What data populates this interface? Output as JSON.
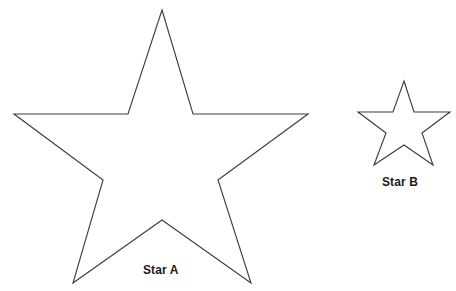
{
  "page": {
    "background_color": "#ffffff",
    "width": 456,
    "height": 291
  },
  "figure": {
    "stroke_color": "#3f3f3f",
    "fill_color": "#ffffff",
    "stroke_width": 1.15,
    "label_color": "#1b1b1b"
  },
  "shapes": [
    {
      "id": "star-a",
      "label": "Star A",
      "type": "five-pointed-star",
      "center": {
        "x": 162,
        "y": 150
      },
      "outer_radius": 146,
      "inner_radius": 57,
      "rotation_deg": -90,
      "points": [
        {
          "name": "top-tip",
          "x": 162,
          "y": 10
        },
        {
          "name": "inner-upper-right",
          "x": 193,
          "y": 114
        },
        {
          "name": "right-tip",
          "x": 308,
          "y": 114
        },
        {
          "name": "inner-lower-right",
          "x": 218,
          "y": 180
        },
        {
          "name": "bottom-right-tip",
          "x": 251,
          "y": 283
        },
        {
          "name": "inner-bottom",
          "x": 162,
          "y": 220
        },
        {
          "name": "bottom-left-tip",
          "x": 73,
          "y": 283
        },
        {
          "name": "inner-lower-left",
          "x": 103,
          "y": 180
        },
        {
          "name": "left-tip",
          "x": 14,
          "y": 114
        },
        {
          "name": "inner-upper-left",
          "x": 128,
          "y": 114
        }
      ],
      "label_position": {
        "x": 143,
        "y": 264
      }
    },
    {
      "id": "star-b",
      "label": "Star B",
      "type": "five-pointed-star",
      "center": {
        "x": 404,
        "y": 124
      },
      "outer_radius": 46,
      "inner_radius": 18,
      "rotation_deg": -90,
      "points": [
        {
          "name": "top-tip",
          "x": 404,
          "y": 81
        },
        {
          "name": "inner-upper-right",
          "x": 414,
          "y": 112
        },
        {
          "name": "right-tip",
          "x": 450,
          "y": 112
        },
        {
          "name": "inner-lower-right",
          "x": 422,
          "y": 133
        },
        {
          "name": "bottom-right-tip",
          "x": 433,
          "y": 165
        },
        {
          "name": "inner-bottom",
          "x": 404,
          "y": 145
        },
        {
          "name": "bottom-left-tip",
          "x": 374,
          "y": 165
        },
        {
          "name": "inner-lower-left",
          "x": 386,
          "y": 133
        },
        {
          "name": "left-tip",
          "x": 358,
          "y": 112
        },
        {
          "name": "inner-upper-left",
          "x": 393,
          "y": 112
        }
      ],
      "label_position": {
        "x": 382,
        "y": 176
      }
    }
  ],
  "polygon_path_star_a": "162,10 193,114 308,114 218,180 251,283 162,220 73,283 103,180 14,114 128,114",
  "polygon_path_star_b": "404,81 414,112 450,112 422,133 433,165 404,145 374,165 386,133 358,112 393,112"
}
